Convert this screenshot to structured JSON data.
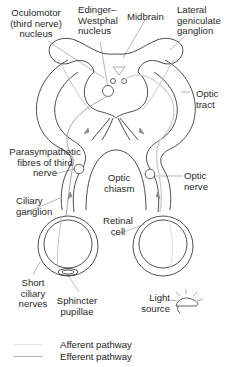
{
  "figure": {
    "topic": "Pupillary light reflex pathway",
    "labels": {
      "oculomotor": "Oculomotor\n(third nerve)\nnucleus",
      "edinger": "Edinger–\nWestphal\nnucleus",
      "midbrain": "Midbrain",
      "lateral_geniculate": "Lateral\ngeniculate\nganglion",
      "optic_tract": "Optic\ntract",
      "parasympathetic": "Parasympathetic\nfibres of third\nnerve",
      "optic_chiasm": "Optic\nchiasm",
      "optic_nerve": "Optic\nnerve",
      "ciliary_ganglion": "Ciliary\nganglion",
      "retinal_cell": "Retinal\ncell",
      "short_ciliary": "Short\nciliary\nnerves",
      "sphincter": "Sphincter\npupillae",
      "light_source": "Light\nsource"
    }
  },
  "legend": [
    {
      "label": "Afferent pathway",
      "color": "#e8e8e8"
    },
    {
      "label": "Efferent pathway",
      "color": "#b8b8b8"
    }
  ],
  "colors": {
    "outline": "#3a3a3a",
    "afferent": "#e0e0e0",
    "efferent": "#a9a9a9",
    "leader": "#9a9a9a"
  }
}
